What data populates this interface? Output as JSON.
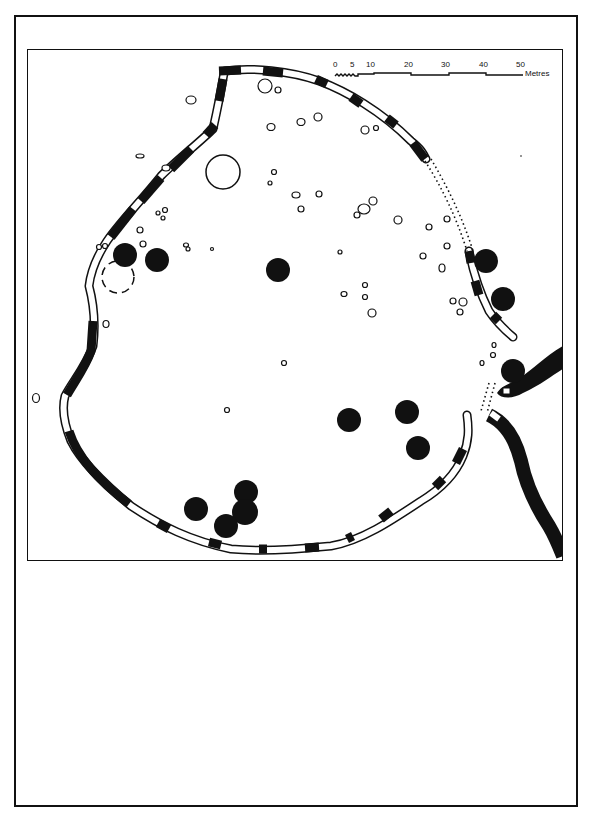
{
  "figure": {
    "type": "archaeological-site-plan",
    "caption_area": ""
  },
  "scale_bar": {
    "ticks": [
      "0",
      "5",
      "10",
      "20",
      "30",
      "40",
      "50"
    ],
    "unit": "Metres"
  },
  "legend_symbols": {
    "rampart_solid": "black filled wall segments",
    "rampart_open": "white outlined wall segments",
    "hut_circle": "black filled circles",
    "pit_or_stone": "small outlined ovals",
    "conjectured": "dashed / dotted lines"
  },
  "colors": {
    "ink": "#111111",
    "paper": "#ffffff"
  },
  "features": {
    "hut_circles_count": 15,
    "large_open_circle_count": 1,
    "dashed_circle_count": 1
  }
}
